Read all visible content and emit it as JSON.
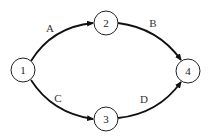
{
  "diagram": {
    "type": "directed-network",
    "nodes": [
      {
        "id": "1",
        "label": "1",
        "x": 23,
        "y": 70
      },
      {
        "id": "2",
        "label": "2",
        "x": 106,
        "y": 23
      },
      {
        "id": "3",
        "label": "3",
        "x": 106,
        "y": 119
      },
      {
        "id": "4",
        "label": "4",
        "x": 188,
        "y": 71
      }
    ],
    "edges": [
      {
        "from": "1",
        "to": "2",
        "label": "A",
        "label_x": 50,
        "label_y": 28
      },
      {
        "from": "2",
        "to": "4",
        "label": "B",
        "label_x": 153,
        "label_y": 23
      },
      {
        "from": "1",
        "to": "3",
        "label": "C",
        "label_x": 58,
        "label_y": 98
      },
      {
        "from": "3",
        "to": "4",
        "label": "D",
        "label_x": 144,
        "label_y": 99
      }
    ]
  }
}
